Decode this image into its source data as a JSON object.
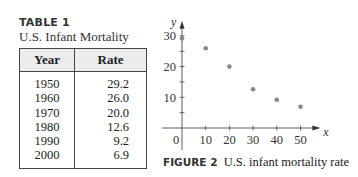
{
  "table": {
    "label": "TABLE 1",
    "title": "U.S. Infant Mortality",
    "headers": [
      "Year",
      "Rate"
    ],
    "rows": [
      [
        "1950",
        "29.2"
      ],
      [
        "1960",
        "26.0"
      ],
      [
        "1970",
        "20.0"
      ],
      [
        "1980",
        "12.6"
      ],
      [
        "1990",
        "9.2"
      ],
      [
        "2000",
        "6.9"
      ]
    ]
  },
  "figure": {
    "label": "FIGURE 2",
    "caption": "U.S. infant mortality rate"
  },
  "chart_data": {
    "type": "scatter",
    "title": "U.S. infant mortality rate",
    "xlabel": "x",
    "ylabel": "y",
    "x": [
      0,
      10,
      20,
      30,
      40,
      50
    ],
    "values": [
      29.2,
      26.0,
      20.0,
      12.6,
      9.2,
      6.9
    ],
    "xticks": [
      "0",
      "10",
      "20",
      "30",
      "40",
      "50"
    ],
    "yticks": [
      "10",
      "20",
      "30"
    ],
    "xlim": [
      0,
      55
    ],
    "ylim": [
      0,
      33
    ],
    "grid": false,
    "legend": null,
    "point_color": "#888888"
  }
}
